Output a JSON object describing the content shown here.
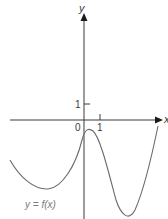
{
  "figure": {
    "type": "function-graph",
    "axes": {
      "x_label": "x",
      "y_label": "y",
      "origin_label": "0",
      "x_tick_label": "1",
      "y_tick_label": "1"
    },
    "curve_label": "y = f(x)",
    "colors": {
      "axis": "#3a3a3a",
      "curve": "#6a6a6a",
      "label": "#7a7a7a"
    },
    "curve_shape": {
      "description": "Quartic-like curve: falls from upper left to a local minimum left of the y-axis, rises to a local maximum just right of the y-axis slightly below the x-axis, falls to a deeper minimum right of x=1, then rises steeply crossing the x-axis at the right edge.",
      "features": [
        {
          "kind": "local_minimum",
          "position": "left of y-axis, below x-axis"
        },
        {
          "kind": "local_maximum",
          "position": "between x=0 and x=1, just below x-axis"
        },
        {
          "kind": "local_minimum",
          "position": "right of x=1, lowest point"
        },
        {
          "kind": "x_intercept",
          "position": "far right"
        }
      ]
    }
  }
}
